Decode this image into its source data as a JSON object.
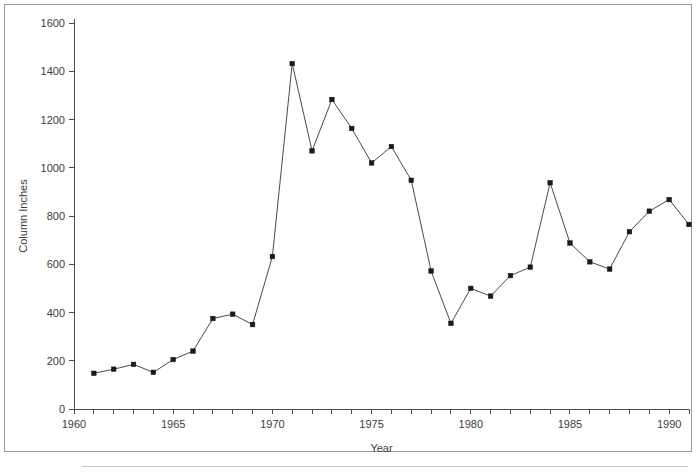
{
  "figure": {
    "frame_border_color": "#9a9a9a",
    "background_color": "#ffffff",
    "line_color": "#4a4a4a",
    "marker_color": "#1a1a1a",
    "axis_color": "#4d4d4d",
    "text_color": "#3c3c3c"
  },
  "chart_data": {
    "type": "line",
    "title": "",
    "subtitle": "",
    "xlabel": "Year",
    "ylabel": "Column Inches",
    "xlim": [
      1960,
      1991
    ],
    "ylim": [
      0,
      1600
    ],
    "grid": false,
    "legend": null,
    "legend_position": "none",
    "x_ticks": [
      1960,
      1961,
      1962,
      1963,
      1964,
      1965,
      1966,
      1967,
      1968,
      1969,
      1970,
      1971,
      1972,
      1973,
      1974,
      1975,
      1976,
      1977,
      1978,
      1979,
      1980,
      1981,
      1982,
      1983,
      1984,
      1985,
      1986,
      1987,
      1988,
      1989,
      1990,
      1991
    ],
    "x_tick_labels": [
      {
        "value": 1960,
        "label": "1960"
      },
      {
        "value": 1965,
        "label": "1965"
      },
      {
        "value": 1970,
        "label": "1970"
      },
      {
        "value": 1975,
        "label": "1975"
      },
      {
        "value": 1980,
        "label": "1980"
      },
      {
        "value": 1985,
        "label": "1985"
      },
      {
        "value": 1990,
        "label": "1990"
      }
    ],
    "y_ticks": [
      0,
      200,
      400,
      600,
      800,
      1000,
      1200,
      1400,
      1600
    ],
    "y_tick_labels": [
      "0",
      "200",
      "400",
      "600",
      "800",
      "1000",
      "1200",
      "1400",
      "1600"
    ],
    "marker": "square",
    "x": [
      1961,
      1962,
      1963,
      1964,
      1965,
      1966,
      1967,
      1968,
      1969,
      1970,
      1971,
      1972,
      1973,
      1974,
      1975,
      1976,
      1977,
      1978,
      1979,
      1980,
      1981,
      1982,
      1983,
      1984,
      1985,
      1986,
      1987,
      1988,
      1989,
      1990,
      1991
    ],
    "values": [
      148,
      165,
      185,
      152,
      205,
      240,
      375,
      393,
      350,
      632,
      1432,
      1070,
      1283,
      1163,
      1020,
      1088,
      948,
      572,
      355,
      500,
      468,
      553,
      588,
      938,
      688,
      610,
      580,
      735,
      820,
      868,
      765
    ],
    "series": [
      {
        "name": "Column Inches",
        "points": [
          {
            "x": 1961,
            "y": 148
          },
          {
            "x": 1962,
            "y": 165
          },
          {
            "x": 1963,
            "y": 185
          },
          {
            "x": 1964,
            "y": 152
          },
          {
            "x": 1965,
            "y": 205
          },
          {
            "x": 1966,
            "y": 240
          },
          {
            "x": 1967,
            "y": 375
          },
          {
            "x": 1968,
            "y": 393
          },
          {
            "x": 1969,
            "y": 350
          },
          {
            "x": 1970,
            "y": 632
          },
          {
            "x": 1971,
            "y": 1432
          },
          {
            "x": 1972,
            "y": 1070
          },
          {
            "x": 1973,
            "y": 1283
          },
          {
            "x": 1974,
            "y": 1163
          },
          {
            "x": 1975,
            "y": 1020
          },
          {
            "x": 1976,
            "y": 1088
          },
          {
            "x": 1977,
            "y": 948
          },
          {
            "x": 1978,
            "y": 572
          },
          {
            "x": 1979,
            "y": 355
          },
          {
            "x": 1980,
            "y": 500
          },
          {
            "x": 1981,
            "y": 468
          },
          {
            "x": 1982,
            "y": 553
          },
          {
            "x": 1983,
            "y": 588
          },
          {
            "x": 1984,
            "y": 938
          },
          {
            "x": 1985,
            "y": 688
          },
          {
            "x": 1986,
            "y": 610
          },
          {
            "x": 1987,
            "y": 580
          },
          {
            "x": 1988,
            "y": 735
          },
          {
            "x": 1989,
            "y": 820
          },
          {
            "x": 1990,
            "y": 868
          },
          {
            "x": 1991,
            "y": 765
          }
        ]
      }
    ]
  }
}
